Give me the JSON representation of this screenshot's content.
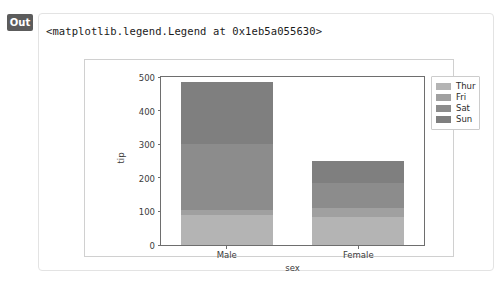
{
  "cell": {
    "badge_label": "Out",
    "repr_text": "<matplotlib.legend.Legend at 0x1eb5a055630>"
  },
  "chart_data": {
    "type": "bar",
    "stacked": true,
    "title": "",
    "xlabel": "sex",
    "ylabel": "tip",
    "categories": [
      "Male",
      "Female"
    ],
    "ylim": [
      0,
      500
    ],
    "yticks": [
      0,
      100,
      200,
      300,
      400,
      500
    ],
    "ytick_labels": [
      "0",
      "100",
      "200",
      "300",
      "400",
      "500"
    ],
    "grid": false,
    "legend_position": "upper right outside",
    "series": [
      {
        "name": "Thur",
        "values": [
          90,
          82
        ],
        "color": "#b4b4b4"
      },
      {
        "name": "Fri",
        "values": [
          15,
          28
        ],
        "color": "#a0a0a0"
      },
      {
        "name": "Sat",
        "values": [
          195,
          75
        ],
        "color": "#8c8c8c"
      },
      {
        "name": "Sun",
        "values": [
          185,
          65
        ],
        "color": "#7f7f7f"
      }
    ],
    "totals": [
      485,
      250
    ],
    "legend_entries": [
      "Thur",
      "Fri",
      "Sat",
      "Sun"
    ]
  },
  "colors": {
    "axes_edge": "#6e6e6e",
    "tick_text": "#3c3c3c",
    "badge_bg": "#5c5c5c",
    "card_border": "#e3e3e3",
    "figure_border": "#d0d0d0"
  }
}
